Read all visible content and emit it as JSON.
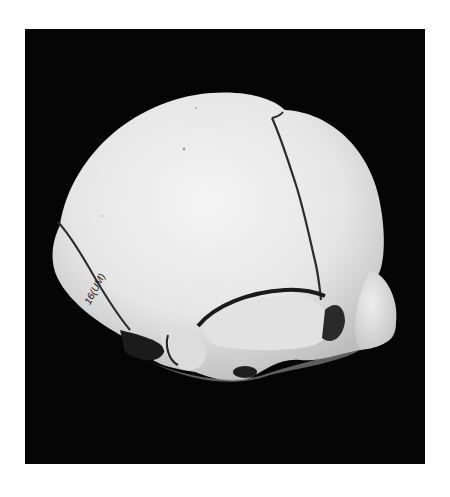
{
  "image": {
    "subject": "infant skull, lateral oblique view",
    "background_color": "#050505",
    "page_color": "#ffffff",
    "bone_color": "#e9e9e9",
    "suture_color": "#2a2a2a",
    "specimen_label": "16(UM)"
  }
}
